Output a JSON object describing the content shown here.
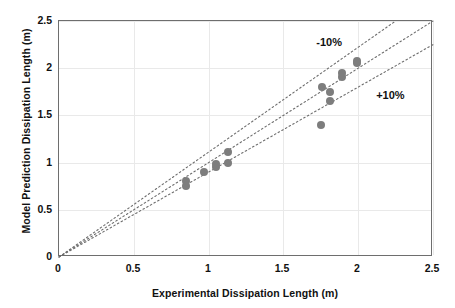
{
  "chart_data": {
    "type": "scatter",
    "title": "",
    "xlabel": "Experimental Dissipation Length (m)",
    "ylabel": "Model Prediction Dissipation Length (m)",
    "xlim": [
      0,
      2.5
    ],
    "ylim": [
      0,
      2.5
    ],
    "xticks": [
      "0",
      "0.5",
      "1",
      "1.5",
      "2",
      "2.5"
    ],
    "yticks": [
      "0",
      "0.5",
      "1",
      "1.5",
      "2",
      "2.5"
    ],
    "xtick_values": [
      0,
      0.5,
      1,
      1.5,
      2,
      2.5
    ],
    "ytick_values": [
      0,
      0.5,
      1,
      1.5,
      2,
      2.5
    ],
    "grid": true,
    "legend": "none",
    "marker_color": "#7d7d7d",
    "marker_shape": "circle",
    "series": [
      {
        "name": "Model vs Experiment",
        "points": [
          {
            "x": 0.85,
            "y": 0.75
          },
          {
            "x": 0.85,
            "y": 0.8
          },
          {
            "x": 0.97,
            "y": 0.9
          },
          {
            "x": 1.05,
            "y": 0.95
          },
          {
            "x": 1.05,
            "y": 0.98
          },
          {
            "x": 1.13,
            "y": 1.0
          },
          {
            "x": 1.13,
            "y": 1.11
          },
          {
            "x": 1.75,
            "y": 1.4
          },
          {
            "x": 1.76,
            "y": 1.8
          },
          {
            "x": 1.81,
            "y": 1.75
          },
          {
            "x": 1.81,
            "y": 1.65
          },
          {
            "x": 1.89,
            "y": 1.91
          },
          {
            "x": 1.89,
            "y": 1.95
          },
          {
            "x": 1.99,
            "y": 2.05
          },
          {
            "x": 1.99,
            "y": 2.08
          }
        ]
      }
    ],
    "reference_lines": [
      {
        "name": "minus-10-percent",
        "slope": 1.111,
        "intercept": 0,
        "style": "dotted",
        "label": "-10%"
      },
      {
        "name": "parity",
        "slope": 1.0,
        "intercept": 0,
        "style": "dotted",
        "label": ""
      },
      {
        "name": "plus-10-percent",
        "slope": 0.9,
        "intercept": 0,
        "style": "dotted",
        "label": "+10%"
      }
    ],
    "annotations": [
      {
        "text": "-10%",
        "x": 1.72,
        "y": 2.27
      },
      {
        "text": "+10%",
        "x": 2.12,
        "y": 1.71
      }
    ]
  }
}
